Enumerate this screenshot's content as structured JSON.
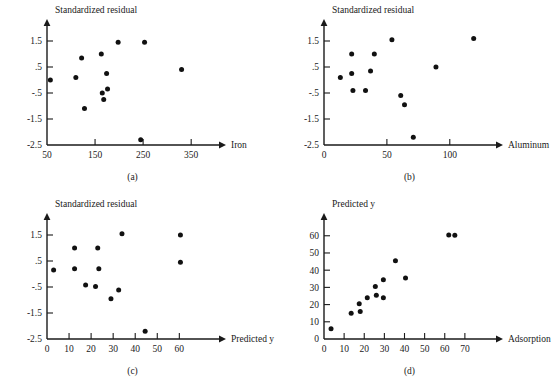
{
  "figure": {
    "title": "",
    "panels": [
      "a",
      "b",
      "c",
      "d"
    ]
  },
  "chart_data": [
    {
      "id": "a",
      "type": "scatter",
      "caption": "(a)",
      "title": "",
      "xlabel": "Iron",
      "ylabel": "Standardized residual",
      "xticks": [
        50,
        150,
        250,
        350
      ],
      "yticks": [
        1.5,
        0.5,
        -0.5,
        -1.5,
        -2.5
      ],
      "yticklabels": [
        "1.5",
        ".5",
        "-.5",
        "-1.5",
        "-2.5"
      ],
      "xlim": [
        50,
        385
      ],
      "ylim": [
        -2.5,
        2.0
      ],
      "grid": false,
      "legend": null,
      "points": [
        {
          "x": 57,
          "y": 0.0
        },
        {
          "x": 110,
          "y": 0.1
        },
        {
          "x": 122,
          "y": 0.85
        },
        {
          "x": 128,
          "y": -1.1
        },
        {
          "x": 163,
          "y": 1.0
        },
        {
          "x": 165,
          "y": -0.5
        },
        {
          "x": 168,
          "y": -0.75
        },
        {
          "x": 174,
          "y": 0.25
        },
        {
          "x": 176,
          "y": -0.35
        },
        {
          "x": 198,
          "y": 1.45
        },
        {
          "x": 245,
          "y": -2.3
        },
        {
          "x": 253,
          "y": 1.45
        },
        {
          "x": 330,
          "y": 0.4
        }
      ]
    },
    {
      "id": "b",
      "type": "scatter",
      "caption": "(b)",
      "title": "",
      "xlabel": "Aluminum",
      "ylabel": "Standardized residual",
      "xticks": [
        0,
        50,
        100
      ],
      "yticks": [
        1.5,
        0.5,
        -0.5,
        -1.5,
        -2.5
      ],
      "yticklabels": [
        "1.5",
        ".5",
        "-.5",
        "-1.5",
        "-2.5"
      ],
      "xlim": [
        0,
        128
      ],
      "ylim": [
        -2.5,
        2.0
      ],
      "grid": false,
      "legend": null,
      "points": [
        {
          "x": 13,
          "y": 0.1
        },
        {
          "x": 22,
          "y": 1.0
        },
        {
          "x": 22,
          "y": 0.25
        },
        {
          "x": 23,
          "y": -0.4
        },
        {
          "x": 33,
          "y": -0.4
        },
        {
          "x": 37,
          "y": 0.35
        },
        {
          "x": 40,
          "y": 1.0
        },
        {
          "x": 54,
          "y": 1.55
        },
        {
          "x": 61,
          "y": -0.6
        },
        {
          "x": 64,
          "y": -0.95
        },
        {
          "x": 71,
          "y": -2.2
        },
        {
          "x": 89,
          "y": 0.5
        },
        {
          "x": 119,
          "y": 1.6
        }
      ]
    },
    {
      "id": "c",
      "type": "scatter",
      "caption": "(c)",
      "title": "",
      "xlabel": "Predicted y",
      "ylabel": "Standardized residual",
      "xticks": [
        0,
        10,
        20,
        30,
        40,
        50,
        60
      ],
      "yticks": [
        1.5,
        0.5,
        -0.5,
        -1.5,
        -2.5
      ],
      "yticklabels": [
        "1.5",
        ".5",
        "-.5",
        "-1.5",
        "-2.5"
      ],
      "xlim": [
        0,
        73
      ],
      "ylim": [
        -2.5,
        2.0
      ],
      "grid": false,
      "legend": null,
      "points": [
        {
          "x": 3,
          "y": 0.15
        },
        {
          "x": 12.5,
          "y": 1.0
        },
        {
          "x": 12.5,
          "y": 0.2
        },
        {
          "x": 17.5,
          "y": -0.42
        },
        {
          "x": 22,
          "y": -0.48
        },
        {
          "x": 23,
          "y": 1.0
        },
        {
          "x": 23.5,
          "y": 0.2
        },
        {
          "x": 29,
          "y": -0.95
        },
        {
          "x": 32.5,
          "y": -0.62
        },
        {
          "x": 34,
          "y": 1.55
        },
        {
          "x": 44.5,
          "y": -2.2
        },
        {
          "x": 60.5,
          "y": 1.5
        },
        {
          "x": 60.5,
          "y": 0.45
        }
      ]
    },
    {
      "id": "d",
      "type": "scatter",
      "caption": "(d)",
      "title": "",
      "xlabel": "Adsorption",
      "ylabel": "Predicted y",
      "xticks": [
        0,
        10,
        20,
        30,
        40,
        50,
        60,
        70
      ],
      "yticks": [
        0,
        10,
        20,
        30,
        40,
        50,
        60
      ],
      "yticklabels": [
        "0",
        "10",
        "20",
        "30",
        "40",
        "50",
        "60"
      ],
      "xlim": [
        0,
        80
      ],
      "ylim": [
        0,
        68
      ],
      "grid": false,
      "legend": null,
      "points": [
        {
          "x": 3.5,
          "y": 6
        },
        {
          "x": 13.5,
          "y": 15
        },
        {
          "x": 17.5,
          "y": 20.5
        },
        {
          "x": 18,
          "y": 16
        },
        {
          "x": 21.5,
          "y": 24
        },
        {
          "x": 25.5,
          "y": 30.5
        },
        {
          "x": 26,
          "y": 25.5
        },
        {
          "x": 29.5,
          "y": 24
        },
        {
          "x": 29.5,
          "y": 34.5
        },
        {
          "x": 35.5,
          "y": 45.5
        },
        {
          "x": 40.5,
          "y": 35.5
        },
        {
          "x": 62,
          "y": 60.5
        },
        {
          "x": 65,
          "y": 60.3
        }
      ]
    }
  ]
}
